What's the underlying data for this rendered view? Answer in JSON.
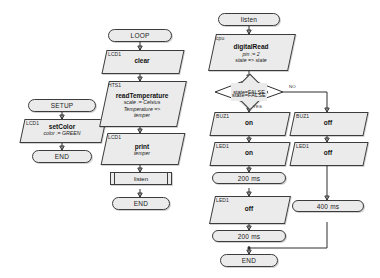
{
  "diagram": {
    "colors": {
      "block_fill": "#ebebeb",
      "stroke": "#3c3c3c",
      "text": "#111111"
    },
    "setup_column": {
      "start": "SETUP",
      "action": {
        "tag": "LCD1",
        "op": "setColor",
        "args": [
          "color := GREEN"
        ]
      },
      "end": "END"
    },
    "loop_column": {
      "start": "LOOP",
      "clear": {
        "tag": "LCD1",
        "op": "clear",
        "args": []
      },
      "read": {
        "tag": "HTS1",
        "op": "readTemperature",
        "args": [
          "scale := Celsius",
          "Temperature =>",
          "temper"
        ]
      },
      "print": {
        "tag": "LCD1",
        "op": "print",
        "args": [
          "temper"
        ]
      },
      "call": "listen",
      "end": "END"
    },
    "listen_column": {
      "start": "listen",
      "read": {
        "tag": "cpu",
        "op": "digitalRead",
        "args": [
          "pin := 2",
          "state => state"
        ]
      },
      "decision": {
        "condition": "state=FALSE",
        "yes_label": "YES",
        "no_label": "NO"
      },
      "yes_branch": [
        {
          "tag": "BUZ1",
          "op": "on",
          "args": []
        },
        {
          "tag": "LED1",
          "op": "on",
          "args": []
        },
        {
          "delay": "200 ms"
        },
        {
          "tag": "LED1",
          "op": "off",
          "args": []
        },
        {
          "delay": "200 ms"
        }
      ],
      "no_branch": [
        {
          "tag": "BUZ1",
          "op": "off",
          "args": []
        },
        {
          "tag": "LED1",
          "op": "off",
          "args": []
        },
        {
          "delay": "400 ms"
        }
      ],
      "end": "END"
    }
  }
}
